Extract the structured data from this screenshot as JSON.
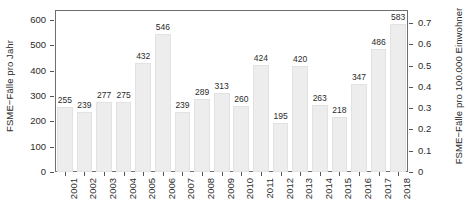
{
  "chart_data": {
    "type": "bar",
    "title": "",
    "subtitle": "",
    "xlabel": "",
    "ylabel": "FSME−Fälle pro Jahr",
    "ylabel_secondary": "FSME−Fälle pro 100.000 Einwohner",
    "categories": [
      "2001",
      "2002",
      "2003",
      "2004",
      "2005",
      "2006",
      "2007",
      "2008",
      "2009",
      "2010",
      "2011",
      "2012",
      "2013",
      "2014",
      "2015",
      "2016",
      "2017",
      "2018"
    ],
    "values": [
      255,
      239,
      277,
      275,
      432,
      546,
      239,
      289,
      313,
      260,
      424,
      195,
      420,
      263,
      218,
      347,
      486,
      583
    ],
    "data_labels": [
      "255",
      "239",
      "277",
      "275",
      "432",
      "546",
      "239",
      "289",
      "313",
      "260",
      "424",
      "195",
      "420",
      "263",
      "218",
      "347",
      "486",
      "583"
    ],
    "ylim": [
      0,
      640
    ],
    "yticks": [
      0,
      100,
      200,
      300,
      400,
      500,
      600
    ],
    "yticklabels": [
      "0",
      "100",
      "200",
      "300",
      "400",
      "500",
      "600"
    ],
    "ylim_secondary": [
      0,
      0.7619
    ],
    "yticks_secondary": [
      0,
      0.1,
      0.2,
      0.3,
      0.4,
      0.5,
      0.6,
      0.7
    ],
    "yticklabels_secondary": [
      "0",
      "0.1",
      "0.2",
      "0.3",
      "0.4",
      "0.5",
      "0.6",
      "0.7"
    ],
    "grid": false,
    "legend": false,
    "legend_position": "none",
    "bar_color": "#ededed",
    "bar_edge_color": "#e2e2e2",
    "axis_color": "#6e6e6e",
    "text_color": "#2b2b2b",
    "background_color": "#ffffff"
  }
}
